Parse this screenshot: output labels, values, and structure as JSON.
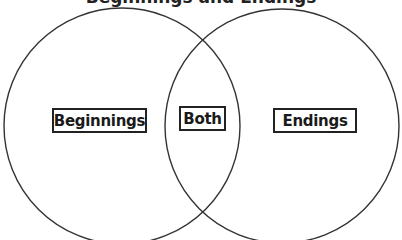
{
  "diagram": {
    "type": "venn",
    "title": "Beginnings and Endings",
    "sets": [
      {
        "label": "Beginnings",
        "region": "left"
      },
      {
        "label": "Both",
        "region": "intersection"
      },
      {
        "label": "Endings",
        "region": "right"
      }
    ],
    "colors": {
      "stroke": "#333333",
      "background": "#ffffff"
    }
  }
}
